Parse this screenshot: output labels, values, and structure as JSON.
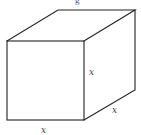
{
  "figure": {
    "type": "cube",
    "caption_fragment": "g",
    "stroke_color": "#222222",
    "label_color": "#444444",
    "vertices": {
      "front_top_left": [
        7,
        41
      ],
      "front_top_right": [
        84,
        41
      ],
      "front_bottom_left": [
        7,
        120
      ],
      "front_bottom_right": [
        84,
        120
      ],
      "back_top_left": [
        58,
        10
      ],
      "back_top_right": [
        135,
        10
      ],
      "back_bottom_right": [
        135,
        90
      ]
    },
    "labels": [
      {
        "id": "height",
        "text": "x",
        "x": 89,
        "y": 75
      },
      {
        "id": "depth",
        "text": "x",
        "x": 112,
        "y": 113
      },
      {
        "id": "width",
        "text": "x",
        "x": 41,
        "y": 133
      }
    ]
  }
}
